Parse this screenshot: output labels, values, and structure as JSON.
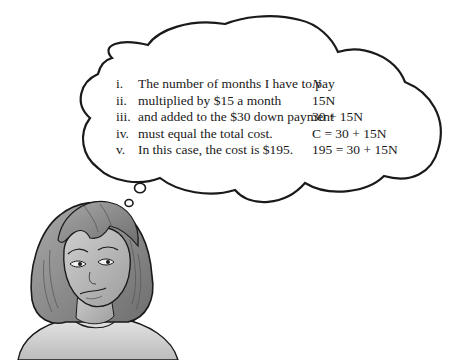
{
  "thought_bubble": {
    "lines": [
      {
        "numeral": "i.",
        "statement": "The number of months I have to pay",
        "expression": "N"
      },
      {
        "numeral": "ii.",
        "statement": "multiplied by $15 a month",
        "expression": "15N"
      },
      {
        "numeral": "iii.",
        "statement": "and added to the $30 down payment",
        "expression": "30 + 15N"
      },
      {
        "numeral": "iv.",
        "statement": "must equal the total cost.",
        "expression": "C = 30 + 15N"
      },
      {
        "numeral": "v.",
        "statement": "In this case, the cost is $195.",
        "expression": "195 = 30 + 15N"
      }
    ]
  },
  "illustration": {
    "subject": "girl-thinking",
    "palette": {
      "outline": "#1a1a1a",
      "hair": "#8a8a8a",
      "skin": "#bdbdbd",
      "shirt": "#d6d6d6",
      "background": "#ffffff"
    }
  }
}
